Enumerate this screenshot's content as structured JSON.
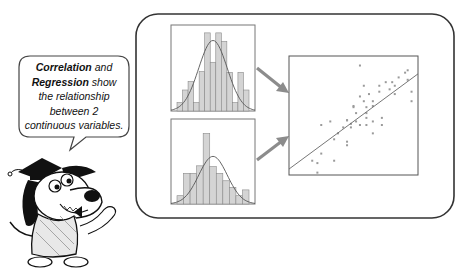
{
  "speech_bubble": {
    "term1": "Correlation",
    "connector1": " and",
    "term2": "Regression",
    "connector2": " show",
    "line3": "the relationship",
    "line4": "between 2",
    "line5": "continuous variables."
  },
  "mascot": {
    "description": "cartoon dog wearing graduation cap and tweed jacket, waving"
  },
  "colors": {
    "frame_stroke": "#333333",
    "bar_fill": "#d4d4d4",
    "bar_stroke": "#8a8a8a",
    "arrow": "#8c8c8c",
    "curve": "#555555",
    "point": "#9a9a9a"
  },
  "chart_data": [
    {
      "type": "bar",
      "title": "",
      "name": "histogram-variable-1",
      "categories": [
        "1",
        "2",
        "3",
        "4",
        "5",
        "6",
        "7",
        "8",
        "9",
        "10",
        "11",
        "12",
        "13"
      ],
      "values": [
        0.1,
        0.25,
        0.35,
        0.1,
        0.47,
        0.93,
        0.58,
        0.93,
        0.83,
        0.46,
        0.1,
        0.46,
        0.25
      ],
      "overlay": "normal curve",
      "xlabel": "",
      "ylabel": ""
    },
    {
      "type": "bar",
      "title": "",
      "name": "histogram-variable-2",
      "categories": [
        "1",
        "2",
        "3",
        "4",
        "5",
        "6",
        "7",
        "8",
        "9",
        "10",
        "11"
      ],
      "values": [
        0.1,
        0.37,
        0.37,
        0.46,
        0.85,
        0.45,
        0.37,
        0.28,
        0.2,
        0.1,
        0.17
      ],
      "overlay": "normal curve",
      "xlabel": "",
      "ylabel": ""
    },
    {
      "type": "scatter",
      "title": "",
      "name": "scatter-with-regression-line",
      "x": [
        0.18,
        0.22,
        0.25,
        0.25,
        0.32,
        0.35,
        0.35,
        0.38,
        0.42,
        0.45,
        0.45,
        0.45,
        0.45,
        0.48,
        0.48,
        0.5,
        0.5,
        0.52,
        0.52,
        0.55,
        0.55,
        0.58,
        0.58,
        0.6,
        0.6,
        0.6,
        0.6,
        0.62,
        0.65,
        0.65,
        0.65,
        0.65,
        0.7,
        0.7,
        0.72,
        0.72,
        0.75,
        0.78,
        0.8,
        0.82,
        0.82,
        0.85,
        0.9,
        0.92,
        0.92,
        0.95,
        0.95,
        0.55,
        0.22
      ],
      "y": [
        0.12,
        0.1,
        0.18,
        0.42,
        0.45,
        0.12,
        0.3,
        0.35,
        0.4,
        0.46,
        0.46,
        0.28,
        0.25,
        0.43,
        0.4,
        0.58,
        0.57,
        0.52,
        0.45,
        0.42,
        0.92,
        0.75,
        0.62,
        0.57,
        0.52,
        0.48,
        0.42,
        0.68,
        0.62,
        0.58,
        0.45,
        0.35,
        0.75,
        0.7,
        0.48,
        0.42,
        0.78,
        0.72,
        0.78,
        0.75,
        0.68,
        0.82,
        0.86,
        0.88,
        0.8,
        0.7,
        0.62,
        0.66,
        0.02
      ],
      "regression_line": {
        "x0": 0.0,
        "y0": 0.05,
        "x1": 1.0,
        "y1": 0.85
      },
      "xlabel": "",
      "ylabel": ""
    }
  ]
}
